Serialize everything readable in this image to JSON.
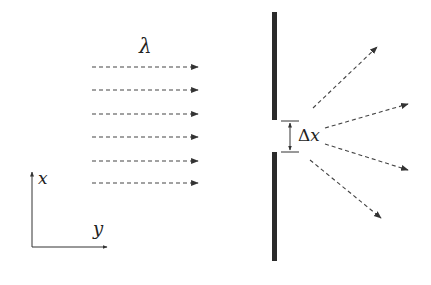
{
  "diagram": {
    "labels": {
      "wavelength": "λ",
      "slit_width_delta": "Δ",
      "slit_width_var": "x",
      "axis_x": "x",
      "axis_y": "y"
    },
    "colors": {
      "wall": "#2b2b2b",
      "ray": "#444444",
      "axis": "#333333"
    },
    "incident_rays": [
      {
        "x1": 92,
        "y1": 67,
        "x2": 198,
        "y2": 67
      },
      {
        "x1": 92,
        "y1": 90,
        "x2": 198,
        "y2": 90
      },
      {
        "x1": 92,
        "y1": 114,
        "x2": 198,
        "y2": 114
      },
      {
        "x1": 92,
        "y1": 137,
        "x2": 198,
        "y2": 137
      },
      {
        "x1": 92,
        "y1": 161,
        "x2": 198,
        "y2": 161
      },
      {
        "x1": 92,
        "y1": 183,
        "x2": 198,
        "y2": 183
      }
    ],
    "diffracted_rays": [
      {
        "x1": 313,
        "y1": 108,
        "x2": 377,
        "y2": 47
      },
      {
        "x1": 325,
        "y1": 128,
        "x2": 408,
        "y2": 104
      },
      {
        "x1": 325,
        "y1": 144,
        "x2": 408,
        "y2": 170
      },
      {
        "x1": 310,
        "y1": 160,
        "x2": 381,
        "y2": 218
      }
    ],
    "wall": {
      "x": 272,
      "width": 5,
      "top_segment": {
        "y1": 12,
        "y2": 120
      },
      "bottom_segment": {
        "y1": 152,
        "y2": 261
      }
    }
  }
}
